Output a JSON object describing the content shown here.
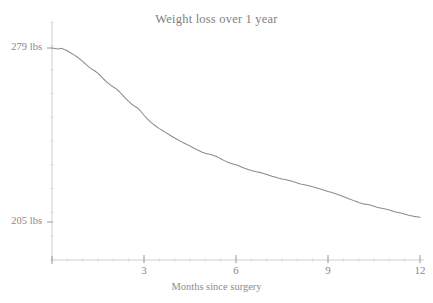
{
  "chart": {
    "title": "Weight loss over 1 year",
    "xlabel": "Months since surgery",
    "ylabel": ""
  },
  "axes": {
    "y_ticks": [
      {
        "label": "279 lbs",
        "value": 279
      },
      {
        "label": "205 lbs",
        "value": 205
      }
    ],
    "x_ticks": [
      {
        "label": "3",
        "value": 3
      },
      {
        "label": "6",
        "value": 6
      },
      {
        "label": "9",
        "value": 9
      },
      {
        "label": "12",
        "value": 12
      }
    ]
  },
  "colors": {
    "line": "#8c8c8c",
    "axis": "#c9c9c9",
    "text": "#8a8a8a",
    "background": "#ffffff"
  },
  "chart_data": {
    "type": "line",
    "title": "Weight loss over 1 year",
    "xlabel": "Months since surgery",
    "ylabel": "Weight (lbs)",
    "xlim": [
      0,
      12
    ],
    "ylim": [
      205,
      279
    ],
    "grid": false,
    "legend": null,
    "x_tick_labels": [
      "3",
      "6",
      "9",
      "12"
    ],
    "x_tick_values": [
      3,
      6,
      9,
      12
    ],
    "y_tick_labels": [
      "279 lbs",
      "205 lbs"
    ],
    "y_tick_values": [
      279,
      205
    ],
    "series": [
      {
        "name": "Weight",
        "units": "lbs",
        "x": [
          0.0,
          0.1,
          0.2,
          0.3,
          0.4,
          0.5,
          0.6,
          0.7,
          0.8,
          0.9,
          1.0,
          1.1,
          1.2,
          1.3,
          1.4,
          1.5,
          1.6,
          1.7,
          1.8,
          1.9,
          2.0,
          2.1,
          2.2,
          2.3,
          2.4,
          2.5,
          2.6,
          2.7,
          2.8,
          2.9,
          3.0,
          3.1,
          3.2,
          3.3,
          3.4,
          3.5,
          3.6,
          3.7,
          3.8,
          3.9,
          4.0,
          4.1,
          4.2,
          4.3,
          4.4,
          4.5,
          4.6,
          4.7,
          4.8,
          4.9,
          5.0,
          5.1,
          5.2,
          5.3,
          5.4,
          5.5,
          5.6,
          5.7,
          5.8,
          5.9,
          6.0,
          6.1,
          6.2,
          6.3,
          6.4,
          6.5,
          6.6,
          6.7,
          6.8,
          6.9,
          7.0,
          7.1,
          7.2,
          7.3,
          7.4,
          7.5,
          7.6,
          7.7,
          7.8,
          7.9,
          8.0,
          8.1,
          8.2,
          8.3,
          8.4,
          8.5,
          8.6,
          8.7,
          8.8,
          8.9,
          9.0,
          9.1,
          9.2,
          9.3,
          9.4,
          9.5,
          9.6,
          9.7,
          9.8,
          9.9,
          10.0,
          10.1,
          10.2,
          10.3,
          10.4,
          10.5,
          10.6,
          10.7,
          10.8,
          10.9,
          11.0,
          11.1,
          11.2,
          11.3,
          11.4,
          11.5,
          11.6,
          11.7,
          11.8,
          11.9,
          12.0
        ],
        "y": [
          279.0,
          278.8,
          278.6,
          278.9,
          278.4,
          277.8,
          277.0,
          276.2,
          275.4,
          274.4,
          273.3,
          272.1,
          271.0,
          270.0,
          269.2,
          268.2,
          266.9,
          265.6,
          264.4,
          263.3,
          262.4,
          261.6,
          260.4,
          259.0,
          257.6,
          256.3,
          255.1,
          254.2,
          253.4,
          252.0,
          250.4,
          249.0,
          247.7,
          246.6,
          245.6,
          244.7,
          243.9,
          243.1,
          242.3,
          241.5,
          240.7,
          240.0,
          239.3,
          238.6,
          238.0,
          237.3,
          236.6,
          235.9,
          235.3,
          234.7,
          234.2,
          233.9,
          233.6,
          233.2,
          232.6,
          231.9,
          231.2,
          230.6,
          230.1,
          229.7,
          229.3,
          228.8,
          228.3,
          227.8,
          227.3,
          226.9,
          226.6,
          226.3,
          226.0,
          225.6,
          225.2,
          224.8,
          224.4,
          224.0,
          223.6,
          223.3,
          223.1,
          222.8,
          222.4,
          222.0,
          221.6,
          221.2,
          220.9,
          220.6,
          220.3,
          220.0,
          219.6,
          219.2,
          218.8,
          218.4,
          218.0,
          217.6,
          217.2,
          216.8,
          216.3,
          215.8,
          215.3,
          214.8,
          214.3,
          213.8,
          213.3,
          212.9,
          212.6,
          212.4,
          212.1,
          211.7,
          211.3,
          211.0,
          210.7,
          210.4,
          210.1,
          209.7,
          209.3,
          209.0,
          208.7,
          208.4,
          208.0,
          207.7,
          207.4,
          207.2,
          207.0
        ]
      }
    ]
  }
}
